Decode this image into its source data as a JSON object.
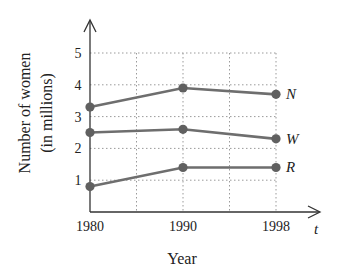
{
  "chart_data": {
    "type": "line",
    "title": "",
    "xlabel": "Year",
    "ylabel_lines": [
      "Number of women",
      "(in millions)"
    ],
    "x_axis_variable": "t",
    "categories": [
      "1980",
      "1990",
      "1998"
    ],
    "x_tick_labels": [
      "1980",
      "1990",
      "1998"
    ],
    "y_ticks": [
      1,
      2,
      3,
      4,
      5
    ],
    "y_tick_labels": [
      "1",
      "2",
      "3",
      "4",
      "5"
    ],
    "ylim": [
      0,
      5.6
    ],
    "grid": true,
    "series": [
      {
        "name": "N",
        "values": [
          3.3,
          3.9,
          3.7
        ]
      },
      {
        "name": "W",
        "values": [
          2.5,
          2.6,
          2.3
        ]
      },
      {
        "name": "R",
        "values": [
          0.8,
          1.4,
          1.4
        ]
      }
    ],
    "legend": "labels at right end of each line",
    "colors": {
      "line": "#6e6e6e",
      "marker": "#606060",
      "axis": "#333333",
      "grid": "#9a9a9a"
    }
  }
}
